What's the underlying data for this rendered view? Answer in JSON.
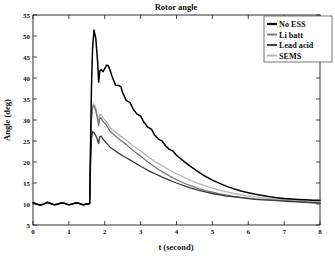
{
  "chart_data": {
    "type": "line",
    "title": "Rotor angle",
    "xlabel": "t (second)",
    "ylabel": "Angle (deg)",
    "xlim": [
      0,
      8
    ],
    "ylim": [
      5,
      55
    ],
    "xticks": [
      "0",
      "1",
      "2",
      "3",
      "4",
      "5",
      "6",
      "7",
      "8"
    ],
    "yticks": [
      "5",
      "10",
      "15",
      "20",
      "25",
      "30",
      "35",
      "40",
      "45",
      "50",
      "55"
    ],
    "grid": false,
    "legend_position": "top-right",
    "colors": {
      "no_ess": "#000000",
      "li_batt": "#777777",
      "lead_acid": "#3a3a3a",
      "sems": "#b5b5b5"
    },
    "series": [
      {
        "name": "No ESS",
        "color": "#000000",
        "x": [
          0,
          0.1,
          0.2,
          0.3,
          0.4,
          0.5,
          0.6,
          0.7,
          0.8,
          0.9,
          1.0,
          1.1,
          1.2,
          1.3,
          1.4,
          1.5,
          1.58,
          1.6,
          1.63,
          1.66,
          1.7,
          1.75,
          1.8,
          1.83,
          1.86,
          1.9,
          1.95,
          2.0,
          2.05,
          2.1,
          2.15,
          2.2,
          2.3,
          2.4,
          2.45,
          2.5,
          2.6,
          2.7,
          2.8,
          2.9,
          3.0,
          3.1,
          3.2,
          3.3,
          3.4,
          3.5,
          3.6,
          3.7,
          3.8,
          3.9,
          4.0,
          4.2,
          4.4,
          4.6,
          4.8,
          5.0,
          5.2,
          5.4,
          5.6,
          5.8,
          6.0,
          6.2,
          6.4,
          6.6,
          6.8,
          7.0,
          7.2,
          7.4,
          7.6,
          7.8,
          8.0
        ],
        "y": [
          10.3,
          10.0,
          9.7,
          10.0,
          10.4,
          10.1,
          9.8,
          10.0,
          10.3,
          10.1,
          9.8,
          10.0,
          10.3,
          10.1,
          9.8,
          10.0,
          10.1,
          22.0,
          38.0,
          47.0,
          51.4,
          49.5,
          44.0,
          39.0,
          41.6,
          42.0,
          41.5,
          42.2,
          43.1,
          42.9,
          41.8,
          40.5,
          38.3,
          38.2,
          37.9,
          36.5,
          34.6,
          34.2,
          32.5,
          31.4,
          30.9,
          29.4,
          28.3,
          27.8,
          26.3,
          25.4,
          25.0,
          23.8,
          23.0,
          22.6,
          21.6,
          20.2,
          18.9,
          17.7,
          16.6,
          15.7,
          14.9,
          14.2,
          13.6,
          13.1,
          12.7,
          12.3,
          12.0,
          11.7,
          11.5,
          11.3,
          11.2,
          11.1,
          11.0,
          10.9,
          10.9
        ]
      },
      {
        "name": "Li batt",
        "color": "#777777",
        "x": [
          0,
          0.1,
          0.2,
          0.3,
          0.4,
          0.5,
          0.6,
          0.7,
          0.8,
          0.9,
          1.0,
          1.1,
          1.2,
          1.3,
          1.4,
          1.5,
          1.58,
          1.6,
          1.63,
          1.66,
          1.7,
          1.75,
          1.8,
          1.83,
          1.86,
          1.9,
          1.95,
          2.0,
          2.05,
          2.1,
          2.15,
          2.2,
          2.3,
          2.4,
          2.5,
          2.6,
          2.7,
          2.8,
          2.9,
          3.0,
          3.1,
          3.2,
          3.3,
          3.4,
          3.5,
          3.6,
          3.8,
          4.0,
          4.2,
          4.4,
          4.6,
          4.8,
          5.0,
          5.2,
          5.4,
          5.6,
          5.8,
          6.0,
          6.2,
          6.4,
          6.6,
          6.8,
          7.0,
          7.2,
          7.4,
          7.6,
          7.8,
          8.0
        ],
        "y": [
          10.3,
          10.0,
          9.7,
          10.0,
          10.4,
          10.1,
          9.8,
          10.0,
          10.3,
          10.1,
          9.8,
          10.0,
          10.3,
          10.1,
          9.8,
          10.0,
          10.1,
          20.0,
          30.0,
          33.0,
          33.4,
          32.2,
          30.2,
          28.6,
          30.4,
          30.5,
          29.6,
          29.3,
          28.7,
          28.0,
          27.3,
          26.9,
          26.2,
          25.4,
          24.8,
          24.2,
          23.4,
          22.7,
          22.0,
          21.4,
          20.7,
          20.0,
          19.4,
          18.8,
          18.2,
          17.7,
          16.7,
          15.8,
          15.0,
          14.3,
          13.7,
          13.2,
          12.8,
          12.4,
          12.1,
          11.8,
          11.6,
          11.4,
          11.2,
          11.1,
          11.0,
          10.9,
          10.8,
          10.7,
          10.6,
          10.5,
          10.4,
          10.3
        ]
      },
      {
        "name": "Lead acid",
        "color": "#3a3a3a",
        "x": [
          0,
          0.1,
          0.2,
          0.3,
          0.4,
          0.5,
          0.6,
          0.7,
          0.8,
          0.9,
          1.0,
          1.1,
          1.2,
          1.3,
          1.4,
          1.5,
          1.58,
          1.6,
          1.63,
          1.66,
          1.7,
          1.75,
          1.8,
          1.83,
          1.86,
          1.9,
          1.95,
          2.0,
          2.05,
          2.1,
          2.15,
          2.2,
          2.3,
          2.4,
          2.5,
          2.6,
          2.7,
          2.8,
          2.9,
          3.0,
          3.1,
          3.2,
          3.3,
          3.4,
          3.5,
          3.6,
          3.8,
          4.0,
          4.2,
          4.4,
          4.6,
          4.8,
          5.0,
          5.2,
          5.4,
          5.6,
          5.8,
          6.0,
          6.2,
          6.4,
          6.6,
          6.8,
          7.0,
          7.2,
          7.4,
          7.6,
          7.8,
          8.0
        ],
        "y": [
          10.3,
          10.0,
          9.7,
          10.0,
          10.4,
          10.1,
          9.8,
          10.0,
          10.3,
          10.1,
          9.8,
          10.0,
          10.3,
          10.1,
          9.8,
          10.0,
          10.1,
          18.0,
          25.5,
          27.2,
          27.0,
          26.3,
          25.2,
          24.4,
          26.0,
          26.2,
          25.4,
          25.0,
          24.5,
          24.0,
          23.5,
          23.2,
          22.6,
          22.0,
          21.5,
          21.0,
          20.5,
          20.0,
          19.5,
          19.0,
          18.5,
          18.0,
          17.6,
          17.2,
          16.8,
          16.4,
          15.7,
          15.0,
          14.4,
          13.8,
          13.3,
          12.9,
          12.5,
          12.2,
          11.9,
          11.7,
          11.5,
          11.3,
          11.1,
          11.0,
          10.9,
          10.8,
          10.7,
          10.6,
          10.5,
          10.4,
          10.3,
          10.2
        ]
      },
      {
        "name": "SEMS",
        "color": "#b5b5b5",
        "x": [
          0,
          0.1,
          0.2,
          0.3,
          0.4,
          0.5,
          0.6,
          0.7,
          0.8,
          0.9,
          1.0,
          1.1,
          1.2,
          1.3,
          1.4,
          1.5,
          1.58,
          1.6,
          1.63,
          1.66,
          1.7,
          1.75,
          1.8,
          1.83,
          1.86,
          1.9,
          1.95,
          2.0,
          2.05,
          2.1,
          2.15,
          2.2,
          2.3,
          2.4,
          2.5,
          2.6,
          2.7,
          2.8,
          2.9,
          3.0,
          3.1,
          3.2,
          3.3,
          3.4,
          3.5,
          3.6,
          3.8,
          4.0,
          4.2,
          4.4,
          4.6,
          4.8,
          5.0,
          5.2,
          5.4,
          5.6,
          5.8,
          6.0,
          6.2,
          6.4,
          6.6,
          6.8,
          7.0,
          7.2,
          7.4,
          7.6,
          7.8,
          8.0
        ],
        "y": [
          10.3,
          10.0,
          9.7,
          10.0,
          10.4,
          10.1,
          9.8,
          10.0,
          10.3,
          10.1,
          9.8,
          10.0,
          10.3,
          10.1,
          9.8,
          10.0,
          10.1,
          21.0,
          31.0,
          33.6,
          33.9,
          32.8,
          30.9,
          29.4,
          31.2,
          31.3,
          30.4,
          30.1,
          29.5,
          28.9,
          28.2,
          27.8,
          27.1,
          26.4,
          25.8,
          25.2,
          24.5,
          23.8,
          23.2,
          22.6,
          21.9,
          21.3,
          20.7,
          20.1,
          19.6,
          19.1,
          18.1,
          17.2,
          16.4,
          15.6,
          14.9,
          14.3,
          13.8,
          13.3,
          12.9,
          12.5,
          12.2,
          11.9,
          11.7,
          11.5,
          11.3,
          11.2,
          11.1,
          11.0,
          10.9,
          10.8,
          10.7,
          10.6
        ]
      }
    ]
  },
  "legend": {
    "items": [
      {
        "label": "No ESS"
      },
      {
        "label": "Li batt"
      },
      {
        "label": "Lead acid"
      },
      {
        "label": "SEMS"
      }
    ]
  }
}
